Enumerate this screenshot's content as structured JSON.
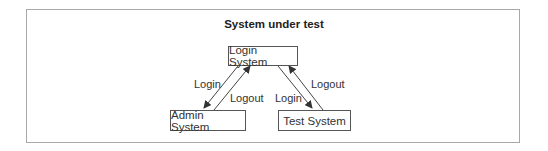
{
  "diagram": {
    "title": "System under test",
    "nodes": {
      "login": "Login System",
      "admin": "Admin System",
      "test": "Test System"
    },
    "edges": {
      "login_to_admin": "Login",
      "admin_to_login": "Logout",
      "login_to_test": "Login",
      "test_to_login": "Logout"
    },
    "colors": {
      "frame": "#a8a8a8",
      "stroke": "#444444",
      "text": "#333333"
    }
  }
}
